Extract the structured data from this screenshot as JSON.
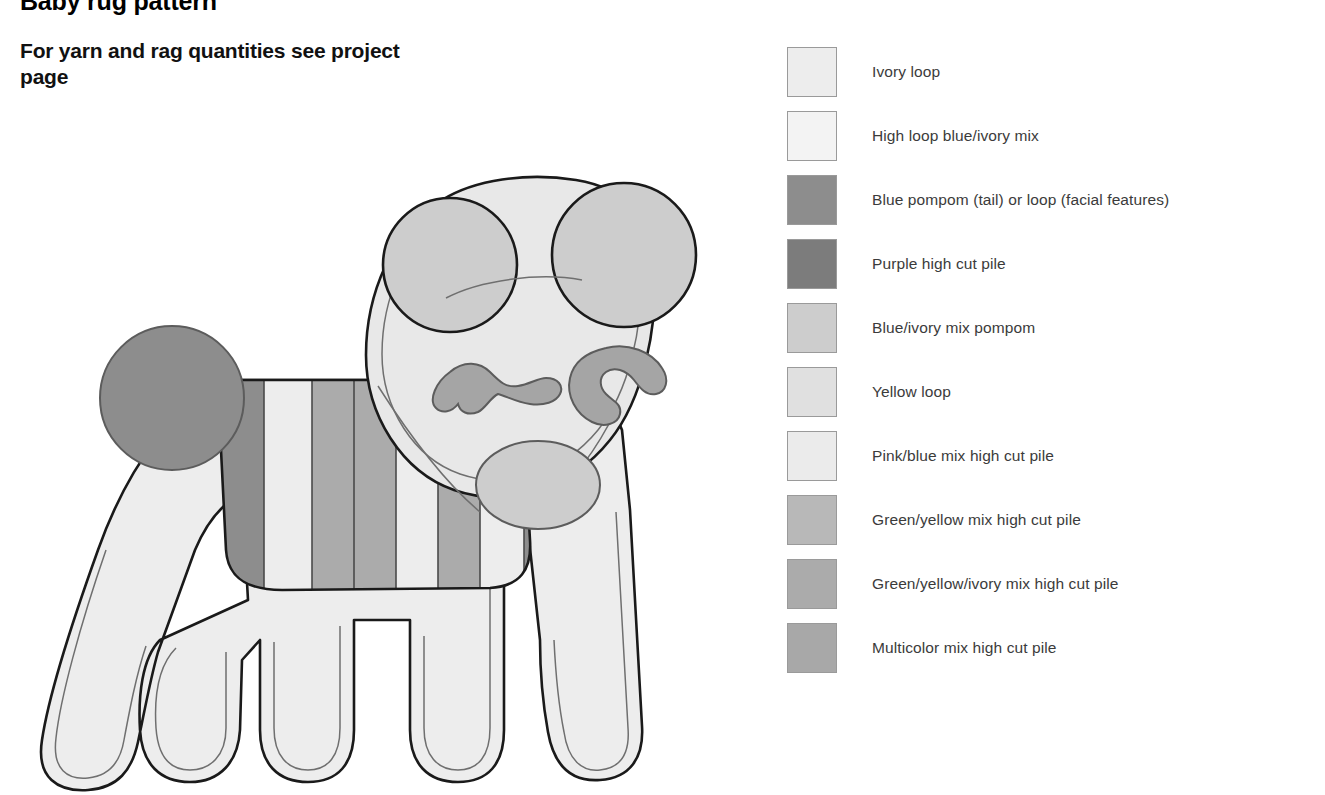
{
  "header": {
    "title": "Baby rug pattern",
    "subtitle": "For yarn and rag quantities see project page"
  },
  "legend": {
    "items": [
      {
        "label": "Ivory loop",
        "color": "#ededed"
      },
      {
        "label": "High loop blue/ivory mix",
        "color": "#f3f3f3"
      },
      {
        "label": "Blue pompom (tail) or loop (facial features)",
        "color": "#8d8d8d"
      },
      {
        "label": "Purple high cut pile",
        "color": "#7c7c7c"
      },
      {
        "label": "Blue/ivory mix pompom",
        "color": "#cdcdcd"
      },
      {
        "label": "Yellow loop",
        "color": "#e0e0e0"
      },
      {
        "label": "Pink/blue mix high cut pile",
        "color": "#ebebeb"
      },
      {
        "label": "Green/yellow mix high cut pile",
        "color": "#b8b8b8"
      },
      {
        "label": "Green/yellow/ivory mix high cut pile",
        "color": "#ababab"
      },
      {
        "label": "Multicolor mix high cut pile",
        "color": "#a8a8a8"
      }
    ]
  },
  "illustration": {
    "name": "dog-rug-pattern",
    "description": "Outline diagram of a dog-shaped rag rug with striped blanket, pompom tail, two round ears, facial features and four legs",
    "colors": {
      "body": "#ededed",
      "face": "#e8e8e8",
      "ear": "#cdcdcd",
      "tail_pompom": "#8d8d8d",
      "chest_pompom": "#cdcdcd",
      "facial_feature": "#a5a5a5",
      "nose": "#a5a5a5",
      "blanket_dark": "#8d8d8d",
      "blanket_mid": "#ababab",
      "blanket_light": "#ededed",
      "outline": "#1a1a1a",
      "inner_line": "#6f6f6f"
    },
    "parts": [
      {
        "name": "left-ear",
        "fill": "#cdcdcd"
      },
      {
        "name": "right-ear",
        "fill": "#cdcdcd"
      },
      {
        "name": "head",
        "fill": "#e8e8e8"
      },
      {
        "name": "eyebrow-left",
        "fill": "#a5a5a5"
      },
      {
        "name": "eyebrow-right",
        "fill": "#a5a5a5"
      },
      {
        "name": "nose",
        "fill": "#a5a5a5"
      },
      {
        "name": "chest-pompom",
        "fill": "#cdcdcd"
      },
      {
        "name": "tail-pompom",
        "fill": "#8d8d8d"
      },
      {
        "name": "body",
        "fill": "#ededed"
      },
      {
        "name": "blanket-stripe-1",
        "fill": "#8d8d8d"
      },
      {
        "name": "blanket-stripe-2",
        "fill": "#ededed"
      },
      {
        "name": "blanket-stripe-3",
        "fill": "#ababab"
      },
      {
        "name": "blanket-stripe-4",
        "fill": "#ababab"
      },
      {
        "name": "blanket-stripe-5",
        "fill": "#ededed"
      },
      {
        "name": "blanket-stripe-6",
        "fill": "#ababab"
      },
      {
        "name": "blanket-stripe-7",
        "fill": "#ededed"
      },
      {
        "name": "blanket-stripe-8",
        "fill": "#8d8d8d"
      }
    ]
  }
}
